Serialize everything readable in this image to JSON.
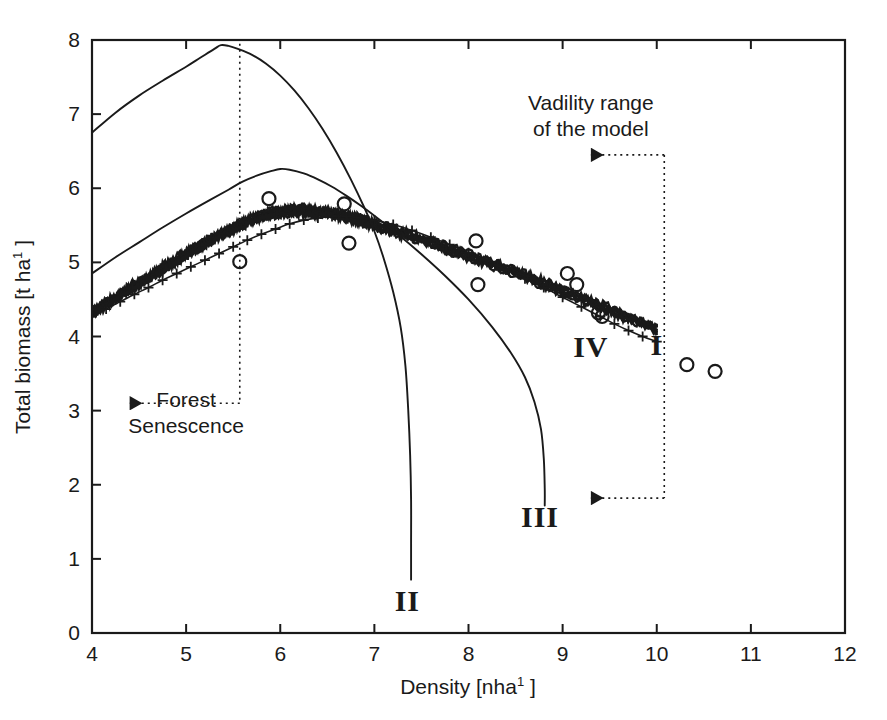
{
  "chart_data": {
    "type": "line",
    "title": "",
    "xlabel": "Density [nha1 ]",
    "xlabel_base": "Density [nha",
    "xlabel_sup": "1",
    "xlabel_tail": " ]",
    "ylabel": "Total biomass [t ha1 ]",
    "ylabel_base": "Total biomass [t ha",
    "ylabel_sup": "1",
    "ylabel_tail": " ]",
    "xlim": [
      4,
      12
    ],
    "ylim": [
      0,
      8
    ],
    "xticks": [
      4,
      5,
      6,
      7,
      8,
      9,
      10,
      11,
      12
    ],
    "yticks": [
      0,
      1,
      2,
      3,
      4,
      5,
      6,
      7,
      8
    ],
    "xtick_labels": [
      "4",
      "5",
      "6",
      "7",
      "8",
      "9",
      "10",
      "11",
      "12"
    ],
    "ytick_labels": [
      "0",
      "1",
      "2",
      "3",
      "4",
      "5",
      "6",
      "7",
      "8"
    ],
    "grid": false,
    "legend_position": "inline-curve-labels",
    "series": [
      {
        "name": "I",
        "label": "I",
        "style": "thick-noisy-band",
        "marker": "none",
        "label_xy": [
          10.0,
          3.75
        ],
        "points": [
          [
            4.0,
            4.32
          ],
          [
            4.12,
            4.42
          ],
          [
            4.25,
            4.52
          ],
          [
            4.37,
            4.62
          ],
          [
            4.5,
            4.72
          ],
          [
            4.62,
            4.82
          ],
          [
            4.75,
            4.92
          ],
          [
            4.87,
            5.01
          ],
          [
            5.0,
            5.11
          ],
          [
            5.12,
            5.2
          ],
          [
            5.25,
            5.29
          ],
          [
            5.37,
            5.38
          ],
          [
            5.5,
            5.46
          ],
          [
            5.62,
            5.53
          ],
          [
            5.75,
            5.6
          ],
          [
            5.87,
            5.65
          ],
          [
            6.0,
            5.68
          ],
          [
            6.12,
            5.7
          ],
          [
            6.25,
            5.7
          ],
          [
            6.37,
            5.69
          ],
          [
            6.5,
            5.67
          ],
          [
            6.62,
            5.64
          ],
          [
            6.75,
            5.6
          ],
          [
            6.87,
            5.56
          ],
          [
            7.0,
            5.51
          ],
          [
            7.25,
            5.41
          ],
          [
            7.5,
            5.31
          ],
          [
            7.75,
            5.2
          ],
          [
            8.0,
            5.09
          ],
          [
            8.25,
            4.98
          ],
          [
            8.5,
            4.86
          ],
          [
            8.75,
            4.74
          ],
          [
            9.0,
            4.62
          ],
          [
            9.25,
            4.49
          ],
          [
            9.5,
            4.36
          ],
          [
            9.75,
            4.23
          ],
          [
            10.0,
            4.1
          ]
        ]
      },
      {
        "name": "II",
        "label": "II",
        "style": "thin-line",
        "marker": "none",
        "label_xy": [
          7.35,
          0.3
        ],
        "points": [
          [
            4.0,
            6.75
          ],
          [
            4.25,
            7.02
          ],
          [
            4.5,
            7.25
          ],
          [
            4.75,
            7.45
          ],
          [
            5.0,
            7.64
          ],
          [
            5.15,
            7.76
          ],
          [
            5.3,
            7.88
          ],
          [
            5.37,
            7.93
          ],
          [
            5.45,
            7.92
          ],
          [
            5.55,
            7.88
          ],
          [
            5.7,
            7.8
          ],
          [
            5.85,
            7.68
          ],
          [
            6.0,
            7.52
          ],
          [
            6.15,
            7.32
          ],
          [
            6.3,
            7.08
          ],
          [
            6.45,
            6.8
          ],
          [
            6.6,
            6.48
          ],
          [
            6.75,
            6.12
          ],
          [
            6.9,
            5.72
          ],
          [
            7.0,
            5.42
          ],
          [
            7.1,
            5.05
          ],
          [
            7.2,
            4.6
          ],
          [
            7.28,
            4.12
          ],
          [
            7.33,
            3.6
          ],
          [
            7.36,
            3.0
          ],
          [
            7.38,
            2.4
          ],
          [
            7.39,
            1.8
          ],
          [
            7.39,
            1.2
          ],
          [
            7.39,
            0.72
          ]
        ]
      },
      {
        "name": "III",
        "label": "III",
        "style": "thin-line",
        "marker": "none",
        "label_xy": [
          8.76,
          1.43
        ],
        "points": [
          [
            4.0,
            4.85
          ],
          [
            4.25,
            5.07
          ],
          [
            4.5,
            5.27
          ],
          [
            4.75,
            5.47
          ],
          [
            5.0,
            5.66
          ],
          [
            5.25,
            5.84
          ],
          [
            5.45,
            5.98
          ],
          [
            5.6,
            6.09
          ],
          [
            5.75,
            6.17
          ],
          [
            5.9,
            6.23
          ],
          [
            6.0,
            6.26
          ],
          [
            6.1,
            6.25
          ],
          [
            6.25,
            6.2
          ],
          [
            6.4,
            6.12
          ],
          [
            6.55,
            6.02
          ],
          [
            6.7,
            5.9
          ],
          [
            6.85,
            5.77
          ],
          [
            7.0,
            5.63
          ],
          [
            7.25,
            5.38
          ],
          [
            7.5,
            5.11
          ],
          [
            7.75,
            4.82
          ],
          [
            8.0,
            4.5
          ],
          [
            8.25,
            4.13
          ],
          [
            8.45,
            3.78
          ],
          [
            8.6,
            3.45
          ],
          [
            8.7,
            3.12
          ],
          [
            8.77,
            2.75
          ],
          [
            8.8,
            2.35
          ],
          [
            8.81,
            1.95
          ],
          [
            8.81,
            1.72
          ]
        ]
      },
      {
        "name": "IV",
        "label": "IV",
        "style": "plus-marker-line",
        "marker": "+",
        "label_xy": [
          9.3,
          3.72
        ],
        "points": [
          [
            4.0,
            4.27
          ],
          [
            4.15,
            4.37
          ],
          [
            4.3,
            4.47
          ],
          [
            4.45,
            4.57
          ],
          [
            4.6,
            4.66
          ],
          [
            4.75,
            4.76
          ],
          [
            4.9,
            4.85
          ],
          [
            5.05,
            4.94
          ],
          [
            5.2,
            5.03
          ],
          [
            5.35,
            5.12
          ],
          [
            5.5,
            5.21
          ],
          [
            5.65,
            5.3
          ],
          [
            5.8,
            5.38
          ],
          [
            5.95,
            5.45
          ],
          [
            6.1,
            5.52
          ],
          [
            6.25,
            5.57
          ],
          [
            6.4,
            5.6
          ],
          [
            6.55,
            5.62
          ],
          [
            6.7,
            5.62
          ],
          [
            6.85,
            5.6
          ],
          [
            7.0,
            5.57
          ],
          [
            7.2,
            5.51
          ],
          [
            7.4,
            5.43
          ],
          [
            7.6,
            5.34
          ],
          [
            7.8,
            5.24
          ],
          [
            8.0,
            5.13
          ],
          [
            8.2,
            5.02
          ],
          [
            8.4,
            4.9
          ],
          [
            8.6,
            4.78
          ],
          [
            8.8,
            4.66
          ],
          [
            9.0,
            4.53
          ],
          [
            9.2,
            4.4
          ],
          [
            9.4,
            4.27
          ],
          [
            9.55,
            4.17
          ],
          [
            9.7,
            4.08
          ],
          [
            9.85,
            4.0
          ],
          [
            10.0,
            3.93
          ]
        ]
      }
    ],
    "scatter": {
      "name": "observations",
      "marker": "open-circle",
      "points": [
        [
          5.57,
          5.01
        ],
        [
          5.88,
          5.86
        ],
        [
          6.68,
          5.79
        ],
        [
          6.73,
          5.26
        ],
        [
          8.08,
          5.29
        ],
        [
          8.1,
          4.7
        ],
        [
          9.05,
          4.85
        ],
        [
          9.15,
          4.7
        ],
        [
          9.38,
          4.32
        ],
        [
          9.42,
          4.27
        ],
        [
          10.32,
          3.62
        ],
        [
          10.62,
          3.53
        ]
      ]
    },
    "annotations": [
      {
        "id": "forest-senescence",
        "text_lines": [
          "Forest",
          "Senescence"
        ],
        "text_x": 5.0,
        "text_y": 3.05,
        "arrow_from": [
          5.57,
          3.1
        ],
        "arrow_to": [
          4.4,
          3.1
        ],
        "guide_line_x": 5.57,
        "guide_from_y": 7.95,
        "guide_to_y": 3.1,
        "style": "dotted"
      },
      {
        "id": "validity-range",
        "text_lines": [
          "Vadility range",
          "of the model"
        ],
        "text_x": 9.3,
        "text_y": 7.05,
        "arrow_from": [
          10.08,
          6.45
        ],
        "arrow_to": [
          9.3,
          6.45
        ],
        "arrow2_from": [
          10.08,
          1.82
        ],
        "arrow2_to": [
          9.3,
          1.82
        ],
        "guide_line_x": 10.08,
        "guide_from_y": 6.45,
        "guide_to_y": 1.82,
        "style": "dotted"
      }
    ],
    "colors": {
      "line": "#1a1a1a",
      "background": "#ffffff",
      "axis": "#1a1a1a",
      "annotation": "#1a1a1a"
    }
  }
}
